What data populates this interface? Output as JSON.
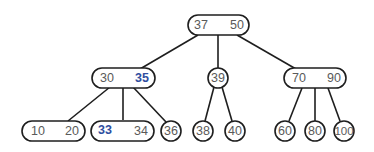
{
  "diagram": {
    "type": "2-3 tree",
    "colors": {
      "stroke": "#1e1e1e",
      "text": "#5a5a5a",
      "highlight": "#2f4ea0",
      "background": "#ffffff"
    },
    "nodes": {
      "root": {
        "keys": [
          "37",
          "50"
        ]
      },
      "n30_35": {
        "keys": [
          "30",
          "35"
        ],
        "highlighted": [
          "35"
        ]
      },
      "n39": {
        "keys": [
          "39"
        ]
      },
      "n70_90": {
        "keys": [
          "70",
          "90"
        ]
      },
      "n10_20": {
        "keys": [
          "10",
          "20"
        ]
      },
      "n33_34": {
        "keys": [
          "33",
          "34"
        ],
        "highlighted": [
          "33"
        ]
      },
      "n36": {
        "keys": [
          "36"
        ]
      },
      "n38": {
        "keys": [
          "38"
        ]
      },
      "n40": {
        "keys": [
          "40"
        ]
      },
      "n60": {
        "keys": [
          "60"
        ]
      },
      "n80": {
        "keys": [
          "80"
        ]
      },
      "n100": {
        "keys": [
          "100"
        ]
      }
    },
    "edges": [
      [
        "root",
        "n30_35"
      ],
      [
        "root",
        "n39"
      ],
      [
        "root",
        "n70_90"
      ],
      [
        "n30_35",
        "n10_20"
      ],
      [
        "n30_35",
        "n33_34"
      ],
      [
        "n30_35",
        "n36"
      ],
      [
        "n39",
        "n38"
      ],
      [
        "n39",
        "n40"
      ],
      [
        "n70_90",
        "n60"
      ],
      [
        "n70_90",
        "n80"
      ],
      [
        "n70_90",
        "n100"
      ]
    ]
  }
}
